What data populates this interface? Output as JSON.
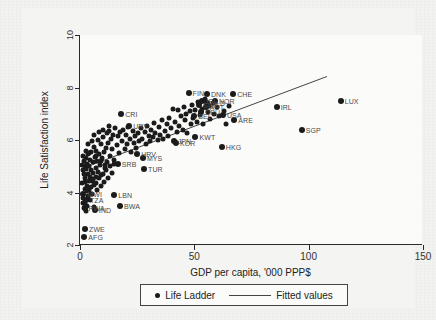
{
  "figure": {
    "background_color": "#f2f2f0",
    "plot_background_color": "#fbfbfa",
    "axis_color": "#2a2a2a",
    "marker_color": "#1b1b1b",
    "line_color": "#444444",
    "label_color": "#4a4a4a"
  },
  "chart_data": {
    "type": "scatter",
    "title": "",
    "xlabel": "GDP per capita, '000 PPP$",
    "ylabel": "Life Satisfaction index",
    "xlim": [
      0,
      150
    ],
    "ylim": [
      2,
      10
    ],
    "xticks": [
      0,
      50,
      100,
      150
    ],
    "yticks": [
      2,
      4,
      6,
      8,
      10
    ],
    "xtick_labels": [
      "0",
      "50",
      "100",
      "150"
    ],
    "ytick_labels": [
      "2",
      "4",
      "6",
      "8",
      "10"
    ],
    "grid": false,
    "legend_position": "below-axes",
    "legend": [
      {
        "name": "Life Ladder",
        "marker": "circle"
      },
      {
        "name": "Fitted values",
        "marker": "line"
      }
    ],
    "fit_line": {
      "x": [
        2.0,
        108.0
      ],
      "y": [
        4.95,
        8.42
      ]
    },
    "series": [
      {
        "name": "Life Ladder",
        "labeled_points": [
          {
            "label": "CRI",
            "x": 18.0,
            "y": 7.0
          },
          {
            "label": "URY",
            "x": 21.5,
            "y": 6.55
          },
          {
            "label": "FIN",
            "x": 47.5,
            "y": 7.8
          },
          {
            "label": "DNK",
            "x": 55.5,
            "y": 7.75
          },
          {
            "label": "CHE",
            "x": 67.0,
            "y": 7.75
          },
          {
            "label": "NOR",
            "x": 59.0,
            "y": 7.5
          },
          {
            "label": "ISL",
            "x": 53.5,
            "y": 7.5
          },
          {
            "label": "NLD",
            "x": 55.5,
            "y": 7.4
          },
          {
            "label": "SWE",
            "x": 52.0,
            "y": 7.35
          },
          {
            "label": "AUT",
            "x": 55.0,
            "y": 7.25
          },
          {
            "label": "USA",
            "x": 62.5,
            "y": 6.95
          },
          {
            "label": "ARE",
            "x": 67.5,
            "y": 6.75
          },
          {
            "label": "DEU",
            "x": 53.0,
            "y": 7.05
          },
          {
            "label": "BEL",
            "x": 50.0,
            "y": 6.9
          },
          {
            "label": "IRL",
            "x": 86.0,
            "y": 7.25
          },
          {
            "label": "LUX",
            "x": 114.0,
            "y": 7.48
          },
          {
            "label": "SGP",
            "x": 97.0,
            "y": 6.4
          },
          {
            "label": "KWT",
            "x": 50.5,
            "y": 6.1
          },
          {
            "label": "HKG",
            "x": 62.0,
            "y": 5.72
          },
          {
            "label": "JPN",
            "x": 41.0,
            "y": 5.95
          },
          {
            "label": "KOR",
            "x": 42.0,
            "y": 5.9
          },
          {
            "label": "HRV",
            "x": 25.0,
            "y": 5.45
          },
          {
            "label": "MYS",
            "x": 27.5,
            "y": 5.3
          },
          {
            "label": "SRB",
            "x": 16.5,
            "y": 5.1
          },
          {
            "label": "TUR",
            "x": 28.0,
            "y": 4.88
          },
          {
            "label": "LBN",
            "x": 15.0,
            "y": 3.9
          },
          {
            "label": "BWA",
            "x": 17.5,
            "y": 3.48
          },
          {
            "label": "MWI",
            "x": 1.5,
            "y": 3.95
          },
          {
            "label": "TZA",
            "x": 2.6,
            "y": 3.72
          },
          {
            "label": "RWA",
            "x": 2.0,
            "y": 3.42
          },
          {
            "label": "IND",
            "x": 6.5,
            "y": 3.32
          },
          {
            "label": "ZWE",
            "x": 2.2,
            "y": 2.62
          },
          {
            "label": "AFG",
            "x": 1.9,
            "y": 2.3
          }
        ],
        "unlabeled_points": [
          {
            "x": 1.0,
            "y": 5.05
          },
          {
            "x": 1.3,
            "y": 4.85
          },
          {
            "x": 1.6,
            "y": 4.7
          },
          {
            "x": 1.8,
            "y": 5.2
          },
          {
            "x": 2.0,
            "y": 4.55
          },
          {
            "x": 2.2,
            "y": 5.0
          },
          {
            "x": 2.4,
            "y": 4.4
          },
          {
            "x": 2.6,
            "y": 4.9
          },
          {
            "x": 2.8,
            "y": 5.3
          },
          {
            "x": 3.0,
            "y": 4.25
          },
          {
            "x": 3.2,
            "y": 5.1
          },
          {
            "x": 3.4,
            "y": 4.7
          },
          {
            "x": 3.6,
            "y": 5.45
          },
          {
            "x": 3.8,
            "y": 4.1
          },
          {
            "x": 4.0,
            "y": 5.0
          },
          {
            "x": 4.2,
            "y": 4.6
          },
          {
            "x": 4.4,
            "y": 5.25
          },
          {
            "x": 4.6,
            "y": 3.95
          },
          {
            "x": 4.8,
            "y": 4.85
          },
          {
            "x": 5.0,
            "y": 5.55
          },
          {
            "x": 5.2,
            "y": 4.45
          },
          {
            "x": 5.5,
            "y": 5.15
          },
          {
            "x": 5.8,
            "y": 4.75
          },
          {
            "x": 6.0,
            "y": 5.75
          },
          {
            "x": 6.2,
            "y": 4.3
          },
          {
            "x": 6.5,
            "y": 5.35
          },
          {
            "x": 6.8,
            "y": 4.95
          },
          {
            "x": 7.0,
            "y": 5.6
          },
          {
            "x": 7.2,
            "y": 4.6
          },
          {
            "x": 7.5,
            "y": 5.2
          },
          {
            "x": 7.8,
            "y": 6.0
          },
          {
            "x": 8.0,
            "y": 4.8
          },
          {
            "x": 8.3,
            "y": 5.45
          },
          {
            "x": 8.6,
            "y": 5.05
          },
          {
            "x": 9.0,
            "y": 5.85
          },
          {
            "x": 9.3,
            "y": 4.65
          },
          {
            "x": 9.6,
            "y": 5.3
          },
          {
            "x": 10.0,
            "y": 6.1
          },
          {
            "x": 10.4,
            "y": 5.55
          },
          {
            "x": 10.8,
            "y": 4.95
          },
          {
            "x": 11.2,
            "y": 5.7
          },
          {
            "x": 11.6,
            "y": 6.25
          },
          {
            "x": 12.0,
            "y": 5.15
          },
          {
            "x": 12.4,
            "y": 5.9
          },
          {
            "x": 12.8,
            "y": 6.35
          },
          {
            "x": 13.2,
            "y": 5.4
          },
          {
            "x": 13.6,
            "y": 6.05
          },
          {
            "x": 14.0,
            "y": 5.65
          },
          {
            "x": 14.5,
            "y": 6.2
          },
          {
            "x": 15.0,
            "y": 5.25
          },
          {
            "x": 15.5,
            "y": 6.45
          },
          {
            "x": 16.0,
            "y": 5.8
          },
          {
            "x": 16.5,
            "y": 6.15
          },
          {
            "x": 17.0,
            "y": 5.5
          },
          {
            "x": 17.5,
            "y": 6.3
          },
          {
            "x": 18.5,
            "y": 5.95
          },
          {
            "x": 19.0,
            "y": 6.4
          },
          {
            "x": 19.5,
            "y": 5.65
          },
          {
            "x": 20.0,
            "y": 6.2
          },
          {
            "x": 20.5,
            "y": 5.85
          },
          {
            "x": 21.0,
            "y": 6.5
          },
          {
            "x": 22.0,
            "y": 6.05
          },
          {
            "x": 22.5,
            "y": 5.55
          },
          {
            "x": 23.0,
            "y": 6.35
          },
          {
            "x": 23.5,
            "y": 5.9
          },
          {
            "x": 24.0,
            "y": 6.15
          },
          {
            "x": 24.5,
            "y": 5.7
          },
          {
            "x": 25.5,
            "y": 6.25
          },
          {
            "x": 26.0,
            "y": 5.95
          },
          {
            "x": 26.5,
            "y": 6.45
          },
          {
            "x": 27.0,
            "y": 6.05
          },
          {
            "x": 28.5,
            "y": 6.3
          },
          {
            "x": 29.0,
            "y": 5.85
          },
          {
            "x": 29.5,
            "y": 6.55
          },
          {
            "x": 30.0,
            "y": 6.15
          },
          {
            "x": 30.5,
            "y": 5.95
          },
          {
            "x": 31.0,
            "y": 6.4
          },
          {
            "x": 32.0,
            "y": 6.1
          },
          {
            "x": 32.5,
            "y": 6.65
          },
          {
            "x": 33.0,
            "y": 6.25
          },
          {
            "x": 34.0,
            "y": 6.0
          },
          {
            "x": 34.5,
            "y": 6.5
          },
          {
            "x": 35.0,
            "y": 6.2
          },
          {
            "x": 36.0,
            "y": 6.75
          },
          {
            "x": 36.5,
            "y": 6.05
          },
          {
            "x": 37.0,
            "y": 6.35
          },
          {
            "x": 38.0,
            "y": 6.6
          },
          {
            "x": 38.5,
            "y": 6.15
          },
          {
            "x": 39.0,
            "y": 6.85
          },
          {
            "x": 40.0,
            "y": 6.45
          },
          {
            "x": 40.5,
            "y": 7.2
          },
          {
            "x": 41.5,
            "y": 6.7
          },
          {
            "x": 42.5,
            "y": 6.3
          },
          {
            "x": 43.0,
            "y": 7.15
          },
          {
            "x": 43.5,
            "y": 6.55
          },
          {
            "x": 44.0,
            "y": 6.9
          },
          {
            "x": 45.0,
            "y": 6.4
          },
          {
            "x": 45.5,
            "y": 7.25
          },
          {
            "x": 46.0,
            "y": 6.75
          },
          {
            "x": 46.5,
            "y": 7.0
          },
          {
            "x": 47.0,
            "y": 6.25
          },
          {
            "x": 48.0,
            "y": 7.1
          },
          {
            "x": 48.5,
            "y": 6.6
          },
          {
            "x": 49.0,
            "y": 7.35
          },
          {
            "x": 49.5,
            "y": 6.85
          },
          {
            "x": 50.5,
            "y": 7.15
          },
          {
            "x": 51.0,
            "y": 6.7
          },
          {
            "x": 51.5,
            "y": 7.45
          },
          {
            "x": 52.5,
            "y": 6.95
          },
          {
            "x": 53.5,
            "y": 7.2
          },
          {
            "x": 54.0,
            "y": 6.6
          },
          {
            "x": 54.5,
            "y": 7.55
          },
          {
            "x": 56.0,
            "y": 7.05
          },
          {
            "x": 56.5,
            "y": 7.3
          },
          {
            "x": 57.0,
            "y": 6.8
          },
          {
            "x": 58.0,
            "y": 7.4
          },
          {
            "x": 58.5,
            "y": 7.0
          },
          {
            "x": 60.0,
            "y": 7.25
          },
          {
            "x": 61.0,
            "y": 6.9
          },
          {
            "x": 63.0,
            "y": 7.1
          },
          {
            "x": 64.0,
            "y": 6.6
          },
          {
            "x": 65.0,
            "y": 7.3
          },
          {
            "x": 0.9,
            "y": 4.35
          },
          {
            "x": 1.1,
            "y": 3.8
          },
          {
            "x": 1.4,
            "y": 3.6
          },
          {
            "x": 1.7,
            "y": 3.4
          },
          {
            "x": 2.1,
            "y": 3.55
          },
          {
            "x": 2.3,
            "y": 4.15
          },
          {
            "x": 2.5,
            "y": 3.3
          },
          {
            "x": 2.9,
            "y": 4.05
          },
          {
            "x": 3.1,
            "y": 3.5
          },
          {
            "x": 3.5,
            "y": 3.85
          },
          {
            "x": 3.9,
            "y": 4.45
          },
          {
            "x": 4.3,
            "y": 3.7
          },
          {
            "x": 4.7,
            "y": 4.2
          },
          {
            "x": 5.3,
            "y": 3.95
          },
          {
            "x": 5.7,
            "y": 4.5
          },
          {
            "x": 6.3,
            "y": 3.45
          },
          {
            "x": 6.9,
            "y": 4.35
          },
          {
            "x": 7.6,
            "y": 4.1
          },
          {
            "x": 8.4,
            "y": 4.55
          },
          {
            "x": 9.1,
            "y": 4.25
          },
          {
            "x": 9.9,
            "y": 4.7
          },
          {
            "x": 10.6,
            "y": 4.4
          },
          {
            "x": 11.4,
            "y": 4.85
          },
          {
            "x": 12.2,
            "y": 4.55
          },
          {
            "x": 13.0,
            "y": 5.0
          },
          {
            "x": 13.9,
            "y": 4.75
          },
          {
            "x": 14.8,
            "y": 5.1
          },
          {
            "x": 1.2,
            "y": 5.4
          },
          {
            "x": 2.7,
            "y": 5.6
          },
          {
            "x": 3.3,
            "y": 5.85
          },
          {
            "x": 4.1,
            "y": 5.5
          },
          {
            "x": 5.1,
            "y": 5.95
          },
          {
            "x": 6.1,
            "y": 6.2
          },
          {
            "x": 7.1,
            "y": 5.4
          },
          {
            "x": 8.1,
            "y": 6.3
          },
          {
            "x": 9.2,
            "y": 5.2
          },
          {
            "x": 10.2,
            "y": 6.4
          },
          {
            "x": 11.0,
            "y": 5.05
          },
          {
            "x": 12.6,
            "y": 6.55
          }
        ]
      }
    ]
  }
}
